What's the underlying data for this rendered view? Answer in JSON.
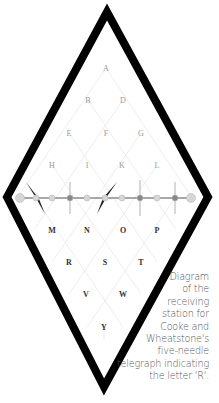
{
  "diagram": {
    "letters_upper": [
      {
        "label": "A",
        "x": 106,
        "y": 68,
        "style": "light"
      },
      {
        "label": "B",
        "x": 88,
        "y": 100,
        "style": "light"
      },
      {
        "label": "D",
        "x": 123,
        "y": 100,
        "style": "light"
      },
      {
        "label": "E",
        "x": 69,
        "y": 133,
        "style": "light"
      },
      {
        "label": "F",
        "x": 106,
        "y": 133,
        "style": "light"
      },
      {
        "label": "G",
        "x": 141,
        "y": 133,
        "style": "light"
      },
      {
        "label": "H",
        "x": 52,
        "y": 165,
        "style": "light"
      },
      {
        "label": "I",
        "x": 87,
        "y": 165,
        "style": "light"
      },
      {
        "label": "K",
        "x": 122,
        "y": 165,
        "style": "light"
      },
      {
        "label": "L",
        "x": 157,
        "y": 165,
        "style": "light"
      }
    ],
    "letters_lower": [
      {
        "label": "M",
        "x": 52,
        "y": 230,
        "style": "bold"
      },
      {
        "label": "N",
        "x": 87,
        "y": 230,
        "style": "bold"
      },
      {
        "label": "O",
        "x": 123,
        "y": 230,
        "style": "bold"
      },
      {
        "label": "P",
        "x": 157,
        "y": 230,
        "style": "bold"
      },
      {
        "label": "R",
        "x": 69,
        "y": 262,
        "style": "bold"
      },
      {
        "label": "S",
        "x": 105,
        "y": 262,
        "style": "bold"
      },
      {
        "label": "T",
        "x": 141,
        "y": 262,
        "style": "bold"
      },
      {
        "label": "V",
        "x": 86,
        "y": 294,
        "style": "bold"
      },
      {
        "label": "W",
        "x": 123,
        "y": 294,
        "style": "bold"
      },
      {
        "label": "Y",
        "x": 104,
        "y": 327,
        "style": "bold"
      }
    ],
    "needles": [
      {
        "index": 1,
        "x": 52,
        "state": "deflected-left"
      },
      {
        "index": 2,
        "x": 87,
        "state": "vertical-faint"
      },
      {
        "index": 3,
        "x": 105,
        "state": "deflected-right"
      },
      {
        "index": 4,
        "x": 140,
        "state": "vertical-faint"
      },
      {
        "index": 5,
        "x": 175,
        "state": "vertical-faint"
      }
    ],
    "indicated_letter": "R",
    "colors": {
      "frame": "#000000",
      "grid_lines": "#e6e6e6",
      "light_letters": "#9a9a9a",
      "bold_letters": "#333333",
      "bar": "#8a8a8a",
      "needle": "#222222"
    }
  },
  "caption": {
    "lines": [
      "Diagram",
      "of the",
      "receiving",
      "station for",
      "Cooke and",
      "Wheatstone's",
      "five-needle",
      "telegraph indicating",
      "the letter 'R'."
    ]
  }
}
